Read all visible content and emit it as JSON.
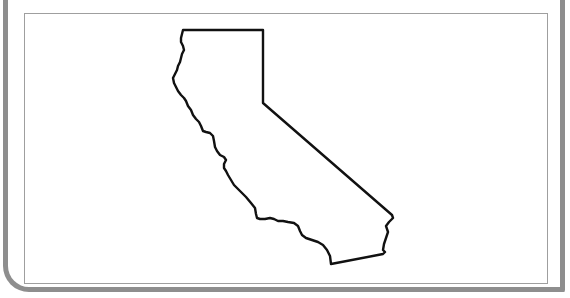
{
  "map": {
    "subject": "California state outline",
    "label": "California",
    "style": {
      "outline_color": "#111111",
      "frame_color": "#8e8e8e",
      "inner_border_color": "#9f9f9f",
      "background": "#ffffff"
    },
    "outline_path": "M183,30 L263,30 L263,103 L392,215 L393,218 L389,222 L386,226 L388,232 L386,238 L384,244 L383,250 L385,252 L383,254 L331,264 L330,256 L327,250 L323,245 L318,242 L312,240 L306,238 L302,235 L300,231 L298,226 L294,223 L288,222 L283,221 L278,221 L274,219 L270,218 L265,219 L260,219 L257,218 L256,214 L255,208 L251,203 L246,197 L240,191 L234,185 L231,180 L228,175 L226,171 L224,168 L224,164 L226,160 L224,157 L220,155 L217,151 L215,147 L214,141 L213,136 L210,133 L206,132 L203,131 L201,126 L199,122 L196,119 L193,115 L191,110 L188,106 L186,101 L184,98 L181,95 L178,91 L176,87 L174,83 L173,78 L175,74 L177,70 L178,66 L180,62 L181,58 L182,54 L184,50 L183,46 L181,42 L181,38 L182,34 L183,30 Z"
  }
}
